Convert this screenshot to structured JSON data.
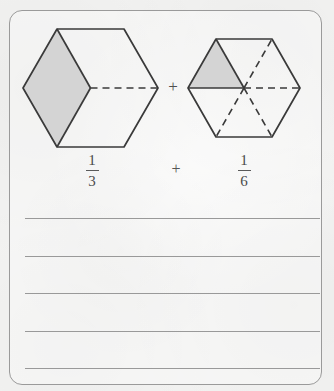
{
  "worksheet": {
    "card": {
      "border_color": "#9a9a9a",
      "background_color": "#f3f3f2"
    },
    "problem": {
      "type": "fraction-addition-with-hexagon-models",
      "operator": "+",
      "operator_between_shapes": "+",
      "expression": "1/3 + 1/6",
      "operands": [
        {
          "numerator": "1",
          "denominator": "3",
          "model": "hexagon-thirds",
          "total_parts": 3,
          "shaded_parts": 1,
          "part_shape": "rhombus"
        },
        {
          "numerator": "1",
          "denominator": "6",
          "model": "hexagon-sixths",
          "total_parts": 6,
          "shaded_parts": 1,
          "part_shape": "triangle"
        }
      ]
    },
    "shapes": {
      "shade_fill": "#d4d4d4",
      "outline_color": "#3a3a3a",
      "divider_dashed_color": "#3a3a3a",
      "hexagon_left": {
        "label": "hexagon-thirds",
        "center_x": 90.5,
        "center_y": 88,
        "radius": 67.5
      },
      "hexagon_right": {
        "label": "hexagon-sixths",
        "center_x": 244,
        "center_y": 88,
        "radius": 56
      }
    },
    "answer_lines": {
      "count": 5,
      "color": "#999999",
      "y_positions": [
        218,
        256,
        293,
        331,
        368
      ]
    }
  }
}
